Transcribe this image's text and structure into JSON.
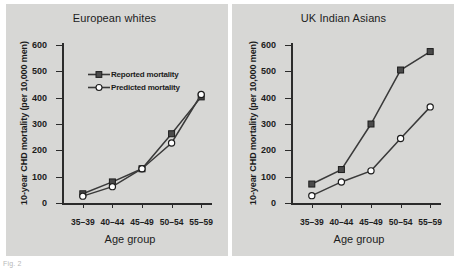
{
  "figure": {
    "caption_fragment": "Fig. 2",
    "background_color": "#d7d7d5",
    "axis_color": "#2b2b2b",
    "reported_color": "#3a3a3a",
    "predicted_color": "#ffffff"
  },
  "axes": {
    "ylabel": "10-year CHD mortality (per 10,000 men)",
    "xlabel": "Age group",
    "yticks": [
      0,
      100,
      200,
      300,
      400,
      500,
      600
    ],
    "ytick_labels": [
      "0",
      "100",
      "200",
      "300",
      "400",
      "500",
      "600"
    ],
    "xtick_labels": [
      "35–39",
      "40–44",
      "45–49",
      "50–54",
      "55–59"
    ]
  },
  "legend": {
    "reported_label": "Reported mortality",
    "predicted_label": "Predicted mortality"
  },
  "chart_data": [
    {
      "type": "line",
      "title": "European whites",
      "xlabel": "Age group",
      "ylabel": "10-year CHD mortality (per 10,000 men)",
      "categories": [
        "35–39",
        "40–44",
        "45–49",
        "50–54",
        "55–59"
      ],
      "ylim": [
        0,
        600
      ],
      "yticks": [
        0,
        100,
        200,
        300,
        400,
        500,
        600
      ],
      "grid": false,
      "legend_position": "upper-left-inside",
      "series": [
        {
          "name": "Reported mortality",
          "marker": "filled-square",
          "values": [
            35,
            80,
            130,
            263,
            403
          ]
        },
        {
          "name": "Predicted mortality",
          "marker": "open-circle",
          "values": [
            26,
            62,
            130,
            228,
            412
          ]
        }
      ]
    },
    {
      "type": "line",
      "title": "UK Indian Asians",
      "xlabel": "Age group",
      "ylabel": "10-year CHD mortality (per 10,000 men)",
      "categories": [
        "35–39",
        "40–44",
        "45–49",
        "50–54",
        "55–59"
      ],
      "ylim": [
        0,
        600
      ],
      "yticks": [
        0,
        100,
        200,
        300,
        400,
        500,
        600
      ],
      "grid": false,
      "legend_position": "upper-left-inside",
      "series": [
        {
          "name": "Reported mortality",
          "marker": "filled-square",
          "values": [
            72,
            127,
            300,
            505,
            575
          ]
        },
        {
          "name": "Predicted mortality",
          "marker": "open-circle",
          "values": [
            28,
            80,
            122,
            245,
            365
          ]
        }
      ]
    }
  ]
}
